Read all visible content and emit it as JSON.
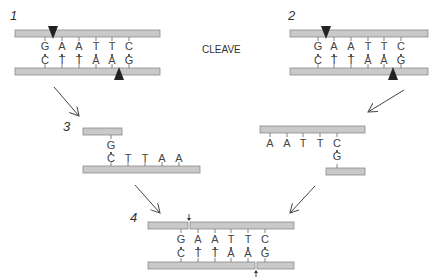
{
  "diagram": {
    "center_label": "CLEAVE",
    "panels": [
      {
        "number": "1",
        "top_strand": [
          "G",
          "A",
          "A",
          "T",
          "T",
          "C"
        ],
        "bottom_strand": [
          "C",
          "T",
          "T",
          "A",
          "A",
          "G"
        ],
        "marker_top": "cut-site-arrow-down",
        "marker_bottom": "cut-site-arrow-up"
      },
      {
        "number": "2",
        "top_strand": [
          "G",
          "A",
          "A",
          "T",
          "T",
          "C"
        ],
        "bottom_strand": [
          "C",
          "T",
          "T",
          "A",
          "A",
          "G"
        ],
        "marker_top": "cut-site-arrow-down",
        "marker_bottom": "cut-site-arrow-up"
      },
      {
        "number": "3",
        "left_fragment": {
          "top": [
            "G"
          ],
          "bottom": [
            "C",
            "T",
            "T",
            "A",
            "A"
          ]
        },
        "right_fragment": {
          "top": [
            "A",
            "A",
            "T",
            "T",
            "C"
          ],
          "bottom": [
            "G"
          ]
        }
      },
      {
        "number": "4",
        "top_strand": [
          "G",
          "A",
          "A",
          "T",
          "T",
          "C"
        ],
        "bottom_strand": [
          "C",
          "T",
          "T",
          "A",
          "A",
          "G"
        ],
        "marker_top": "nick-arrow-down",
        "marker_bottom": "nick-arrow-up"
      }
    ],
    "colors": {
      "strand_fill": "#c9c9c9",
      "strand_stroke": "#8a8a8a",
      "text": "#333333"
    }
  }
}
